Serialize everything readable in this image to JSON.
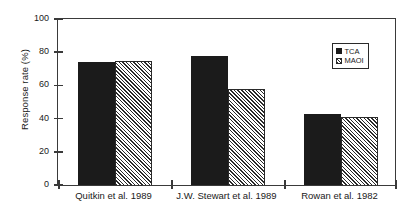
{
  "chart_data": {
    "type": "bar",
    "title": "",
    "xlabel": "",
    "ylabel": "Response rate (%)",
    "ylim": [
      0,
      100
    ],
    "yticks": [
      0,
      20,
      40,
      60,
      80,
      100
    ],
    "grid": false,
    "legend_position": "top-right",
    "categories": [
      "Quitkin et al. 1989",
      "J.W. Stewart et al. 1989",
      "Rowan et al. 1982"
    ],
    "series": [
      {
        "name": "TCA",
        "values": [
          74,
          78,
          43
        ],
        "color": "#1b1b1b",
        "fill": "solid"
      },
      {
        "name": "MAOI",
        "values": [
          75,
          58,
          41
        ],
        "color": "#2a2a2a",
        "fill": "hatched"
      }
    ]
  },
  "legend": {
    "items": [
      {
        "label": "TCA"
      },
      {
        "label": "MAOI"
      }
    ]
  },
  "axis": {
    "y_title": "Response rate (%)",
    "tick_labels": [
      "100",
      "80",
      "60",
      "40",
      "20",
      "0"
    ]
  }
}
